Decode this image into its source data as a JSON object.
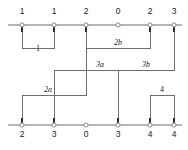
{
  "diagram": {
    "type": "sequence-bracket-diagram",
    "width": 188,
    "height": 150,
    "colors": {
      "background": "#ffffff",
      "axis": "#6e6e6e",
      "connector": "#6e6e6e",
      "stem": "#2b2b2b",
      "node_ring_fill": "#ffffff",
      "node_ring_stroke": "#8a8a8a",
      "text": "#1a1a1a"
    },
    "top_axis": {
      "name": "top-axis",
      "y": 25,
      "x_start": 8,
      "x_end": 182,
      "label_y": 14,
      "nodes": [
        {
          "id": "t1",
          "x": 22,
          "label": "1",
          "has_stem": true
        },
        {
          "id": "t2",
          "x": 54,
          "label": "1",
          "has_stem": true
        },
        {
          "id": "t3",
          "x": 86,
          "label": "2",
          "has_stem": true
        },
        {
          "id": "t4",
          "x": 118,
          "label": "0",
          "has_stem": false
        },
        {
          "id": "t5",
          "x": 150,
          "label": "2",
          "has_stem": true
        },
        {
          "id": "t6",
          "x": 174,
          "label": "3",
          "has_stem": true
        }
      ]
    },
    "bottom_axis": {
      "name": "bottom-axis",
      "y": 125,
      "x_start": 8,
      "x_end": 182,
      "label_y": 137,
      "nodes": [
        {
          "id": "b1",
          "x": 22,
          "label": "2",
          "has_stem": true
        },
        {
          "id": "b2",
          "x": 54,
          "label": "3",
          "has_stem": true
        },
        {
          "id": "b3",
          "x": 86,
          "label": "0",
          "has_stem": false
        },
        {
          "id": "b4",
          "x": 118,
          "label": "3",
          "has_stem": true
        },
        {
          "id": "b5",
          "x": 150,
          "label": "4",
          "has_stem": true
        },
        {
          "id": "b6",
          "x": 174,
          "label": "4",
          "has_stem": true
        }
      ]
    },
    "brackets": [
      {
        "id": "bracket-1",
        "label": "1",
        "italic": false,
        "label_x": 38,
        "label_y": 51,
        "path": "M 22 25 L 22 48 L 54 48 L 54 25"
      },
      {
        "id": "bracket-2b",
        "label": "2b",
        "italic": true,
        "label_x": 118,
        "label_y": 45,
        "path": "M 86 25 L 86 48 L 150 48 L 150 25"
      },
      {
        "id": "bracket-3",
        "label_a": "3a",
        "label_b": "3b",
        "italic": true,
        "label_a_x": 100,
        "label_a_y": 67,
        "label_b_x": 146,
        "label_b_y": 67,
        "path": "M 54 95 L 54 70 L 174 70 L 174 25",
        "drop_path": "M 118 70 L 118 125"
      },
      {
        "id": "bracket-2a",
        "label": "2a",
        "italic": true,
        "label_x": 48,
        "label_y": 92,
        "path": "M 22 125 L 22 95 L 86 95 L 86 25"
      },
      {
        "id": "bracket-4",
        "label": "4",
        "italic": false,
        "label_x": 162,
        "label_y": 92,
        "path": "M 150 125 L 150 95 L 174 95 L 174 125"
      }
    ],
    "extra_stems": [
      {
        "id": "stem-b2-up",
        "x": 54,
        "y1": 125,
        "y2": 95
      }
    ]
  }
}
